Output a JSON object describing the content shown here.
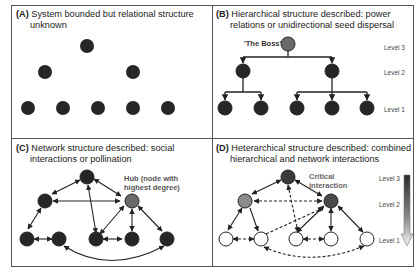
{
  "panels": {
    "a": {
      "letter": "(A)",
      "title_line1": "System bounded but relational structure",
      "title_line2": "unknown"
    },
    "b": {
      "letter": "(B)",
      "title_line1": "Hierarchical structure described: power",
      "title_line2": "relations or unidirectional seed dispersal",
      "boss_label": "'The Boss'",
      "levels": [
        "Level 3",
        "Level 2",
        "Level 1"
      ]
    },
    "c": {
      "letter": "(C)",
      "title_line1": "Network structure described: social",
      "title_line2": "interactions or pollination",
      "hub_label_line1": "Hub (node with",
      "hub_label_line2": "highest degree)"
    },
    "d": {
      "letter": "(D)",
      "title_line1": "Heterarchical structure described: combined",
      "title_line2": "hierarchical and network interactions",
      "critical_label_line1": "Critical",
      "critical_label_line2": "interaction",
      "levels": [
        "Level 3",
        "Level 2",
        "Level 1"
      ]
    }
  },
  "colors": {
    "node_dark": "#262626",
    "node_grey": "#6a6a6a",
    "node_light_grey": "#8c8c8c",
    "node_white": "#ffffff",
    "border": "#555555",
    "label_grey": "#555555"
  }
}
